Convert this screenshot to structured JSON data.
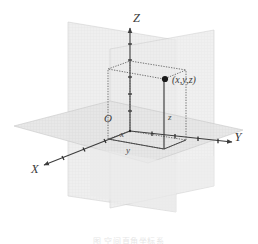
{
  "figure": {
    "caption": "图  空间直角坐标系",
    "background_color": "#ffffff"
  },
  "axes": [
    {
      "id": "z",
      "label": "Z",
      "direction": "up",
      "label_x": 133,
      "label_y": 22
    },
    {
      "id": "y",
      "label": "Y",
      "direction": "right",
      "label_x": 238,
      "label_y": 141
    },
    {
      "id": "x",
      "label": "X",
      "direction": "down-left",
      "label_x": 31,
      "label_y": 173
    }
  ],
  "origin": {
    "label": "O",
    "label_x": 104,
    "label_y": 122,
    "point_x": 117,
    "point_y": 129
  },
  "point": {
    "label": "(x,y,z)",
    "dot_x": 165,
    "dot_y": 79,
    "label_x": 172,
    "label_y": 83
  },
  "segment_labels": [
    {
      "id": "x-segment",
      "text": "x",
      "x": 120,
      "y": 137
    },
    {
      "id": "y-segment",
      "text": "y",
      "x": 126,
      "y": 152
    },
    {
      "id": "z-segment",
      "text": "z",
      "x": 168,
      "y": 120
    }
  ],
  "planes": [
    {
      "id": "xy-plane",
      "name": "horizontal-xy-plane",
      "fill": "#e9e9e9",
      "stroke": "#cfcfcf"
    },
    {
      "id": "xz-plane",
      "name": "vertical-xz-plane",
      "fill": "#e4e4e4",
      "stroke": "#cccccc"
    },
    {
      "id": "yz-plane",
      "name": "vertical-yz-plane",
      "fill": "#e4e4e4",
      "stroke": "#cccccc"
    }
  ],
  "box": {
    "name": "coordinate-box",
    "stroke": "#5a5a5a",
    "style": "dotted",
    "description": "rectangular parallelepiped from origin to point"
  },
  "colors": {
    "axis": "#3d3d3d",
    "plane_fill": "#e7e7e7",
    "plane_edge": "#cdcdcd",
    "box_edge": "#555555",
    "point_dot": "#1a1a1a",
    "text": "#3a3a3a"
  },
  "ticks": {
    "z_axis_count": 5,
    "y_axis_count": 4,
    "x_axis_count": 3
  }
}
